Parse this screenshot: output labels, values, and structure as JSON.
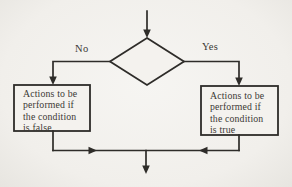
{
  "colors": {
    "bg": "#f1efeb",
    "line": "#2e2c29",
    "text": "#3b3935",
    "box_fill": "#f4f2ee"
  },
  "diagram": {
    "type": "flowchart",
    "decision": {
      "shape": "diamond",
      "label": ""
    },
    "labels": {
      "no": "No",
      "yes": "Yes"
    },
    "boxes": {
      "false_branch": {
        "text": "Actions to be\nperformed if\nthe condition\nis false"
      },
      "true_branch": {
        "text": "Actions to be\nperformed if\nthe condition\nis true"
      }
    }
  }
}
